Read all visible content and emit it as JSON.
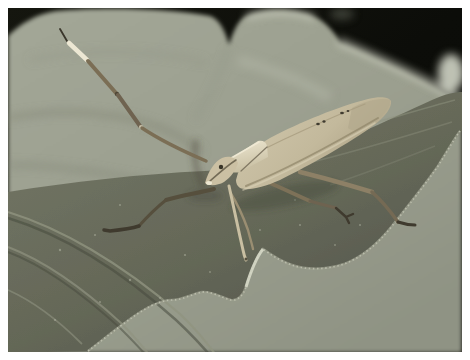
{
  "photo": {
    "kind": "macro-photograph",
    "alt": "A tan leaf-footed bug with one long banded antenna raised diagonally, standing on a large gray-green leaf; dark black background behind the serrated leaf edge; thin white border frames the photo",
    "subject": "leaf-footed bug on a leaf",
    "frame_color": "#ffffff",
    "palette": {
      "frame": "#ffffff",
      "bg_dark": "#0c0d09",
      "bg_dark2": "#15160f",
      "leaf_back": "#a3a797",
      "leaf_back_dim": "#8f9384",
      "leaf_highlight": "#d2d5c6",
      "leaf_front": "#757867",
      "leaf_front_dark": "#50534a",
      "leaf_vein_light": "#909380",
      "leaf_vein_dark": "#474a3e",
      "margin_hair": "#c7cab8",
      "bug_body": "#d2c9ae",
      "bug_body_dark": "#a99e82",
      "bug_accent": "#efe9d4",
      "bug_shadow": "#5c5542",
      "antenna_brown": "#7b6e55",
      "antenna_band": "#ece7d3",
      "antenna_tip": "#3a362b",
      "leg_dark": "#564f3d",
      "tarsus_dark": "#3f3a2e",
      "wing_spot": "#3f3b2f"
    }
  }
}
